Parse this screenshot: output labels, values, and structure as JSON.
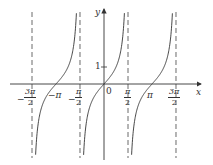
{
  "chart_data": {
    "type": "line",
    "title": "",
    "function": "y = tan x",
    "xlabel": "x",
    "ylabel": "y",
    "series": [
      {
        "name": "tan x branch (-3π/2, -π/2)",
        "center_zero": -3.14159,
        "x_range": [
          -4.712,
          -1.571
        ]
      },
      {
        "name": "tan x branch (-π/2, π/2)",
        "center_zero": 0,
        "x_range": [
          -1.571,
          1.571
        ]
      },
      {
        "name": "tan x branch (π/2, 3π/2)",
        "center_zero": 3.14159,
        "x_range": [
          1.571,
          4.712
        ]
      }
    ],
    "asymptotes": [
      {
        "x": -4.712,
        "label": "-3π/2",
        "style": "dashed"
      },
      {
        "x": -1.571,
        "label": "-π/2",
        "style": "dashed"
      },
      {
        "x": 1.571,
        "label": "π/2",
        "style": "dashed"
      },
      {
        "x": 4.712,
        "label": "3π/2",
        "style": "dashed"
      }
    ],
    "x_ticks": [
      "-3π/2",
      "-π",
      "-π/2",
      "0",
      "π/2",
      "π",
      "3π/2"
    ],
    "y_ticks": [
      "1"
    ],
    "grid": false,
    "legend": null
  },
  "labels": {
    "y_axis": "y",
    "x_axis": "x",
    "origin": "0",
    "y_one": "1",
    "neg_pi": "−π",
    "pi": "π",
    "neg_sign": "−",
    "three_pi": "3π",
    "pi_num": "π",
    "two": "2"
  },
  "colors": {
    "curve": "#333333",
    "axis": "#333333",
    "asymptote": "#444444"
  }
}
